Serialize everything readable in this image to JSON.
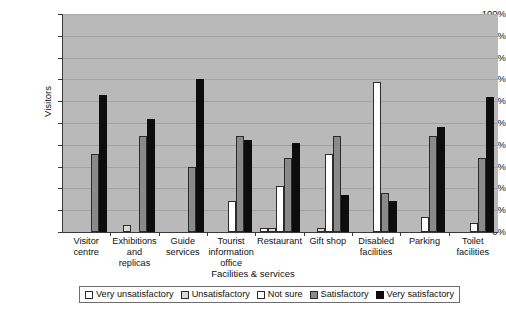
{
  "chart_data": {
    "type": "bar",
    "title": "",
    "xlabel": "Facilities & services",
    "ylabel": "Visitors",
    "ylim": [
      0,
      100
    ],
    "ytick_labels": [
      "100%",
      "90%",
      "80%",
      "70%",
      "60%",
      "50%",
      "40%",
      "30%",
      "20%",
      "10%",
      "0%"
    ],
    "ytick_values": [
      100,
      90,
      80,
      70,
      60,
      50,
      40,
      30,
      20,
      10,
      0
    ],
    "grid": true,
    "legend_position": "bottom",
    "categories": [
      "Visitor centre",
      "Exhibitions and replicas",
      "Guide services",
      "Tourist information office",
      "Restaurant",
      "Gift shop",
      "Disabled facilities",
      "Parking",
      "Toilet facilities"
    ],
    "category_lines": [
      [
        "Visitor",
        "centre"
      ],
      [
        "Exhibitions",
        "and",
        "replicas"
      ],
      [
        "Guide",
        "services"
      ],
      [
        "Tourist",
        "information",
        "office"
      ],
      [
        "Restaurant"
      ],
      [
        "Gift shop"
      ],
      [
        "Disabled",
        "facilities"
      ],
      [
        "Parking"
      ],
      [
        "Toilet",
        "facilities"
      ]
    ],
    "series": [
      {
        "name": "Very unsatisfactory",
        "color": "#ffffff",
        "values": [
          0,
          0,
          0,
          0,
          2,
          0,
          0,
          0,
          0
        ]
      },
      {
        "name": "Unsatisfactory",
        "color": "#d8d8d8",
        "values": [
          0,
          3,
          0,
          0,
          2,
          2,
          0,
          0,
          0
        ]
      },
      {
        "name": "Not sure",
        "color": "#ffffff",
        "values": [
          0,
          0,
          0,
          14,
          21,
          36,
          69,
          7,
          4
        ]
      },
      {
        "name": "Satisfactory",
        "color": "#8a8a8a",
        "values": [
          36,
          44,
          30,
          44,
          34,
          44,
          18,
          44,
          34
        ]
      },
      {
        "name": "Very satisfactory",
        "color": "#0d0d0d",
        "values": [
          63,
          52,
          70,
          42,
          41,
          17,
          14,
          48,
          62
        ]
      }
    ]
  },
  "legend": {
    "items": [
      "Very unsatisfactory",
      "Unsatisfactory",
      "Not sure",
      "Satisfactory",
      "Very satisfactory"
    ]
  }
}
